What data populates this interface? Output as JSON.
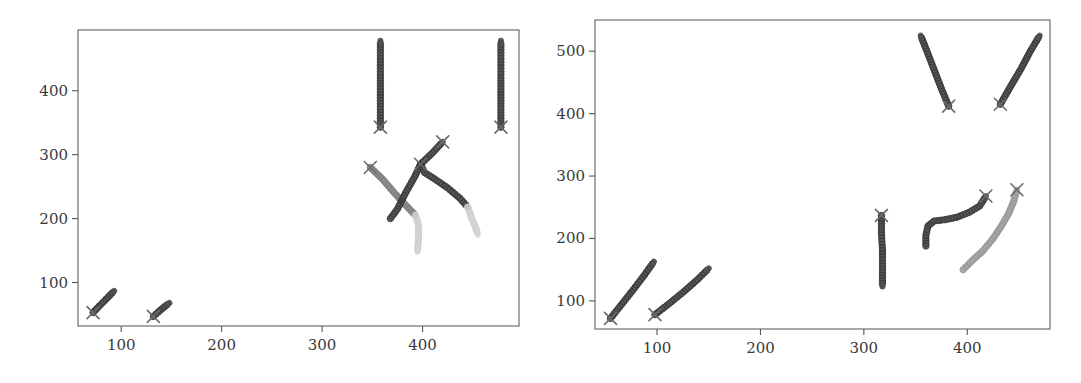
{
  "chart_data": [
    {
      "type": "scatter",
      "title": "",
      "xlabel": "",
      "ylabel": "",
      "xlim": [
        57,
        496
      ],
      "ylim": [
        32,
        495
      ],
      "xticks": [
        100,
        200,
        300,
        400
      ],
      "yticks": [
        100,
        200,
        300,
        400
      ],
      "grid": false,
      "legend": "none",
      "marker_start": "x",
      "marker_trail": "circle",
      "series": [
        {
          "name": "trajectory-1",
          "shade": "dark",
          "start": [
            72,
            53
          ],
          "points": [
            [
              72,
              53
            ],
            [
              78,
              63
            ],
            [
              85,
              74
            ],
            [
              93,
              87
            ]
          ]
        },
        {
          "name": "trajectory-2",
          "shade": "dark",
          "start": [
            132,
            47
          ],
          "points": [
            [
              132,
              47
            ],
            [
              137,
              54
            ],
            [
              143,
              62
            ],
            [
              148,
              68
            ]
          ]
        },
        {
          "name": "trajectory-3",
          "shade": "dark",
          "start": [
            358,
            343
          ],
          "points": [
            [
              358,
              343
            ],
            [
              358,
              380
            ],
            [
              358,
              420
            ],
            [
              358,
              455
            ],
            [
              358,
              478
            ]
          ]
        },
        {
          "name": "trajectory-4",
          "shade": "dark",
          "start": [
            478,
            343
          ],
          "points": [
            [
              478,
              343
            ],
            [
              478,
              380
            ],
            [
              478,
              420
            ],
            [
              478,
              455
            ],
            [
              478,
              478
            ]
          ]
        },
        {
          "name": "trajectory-5",
          "shade": "mid",
          "start": [
            348,
            280
          ],
          "points": [
            [
              348,
              280
            ],
            [
              360,
              262
            ],
            [
              372,
              240
            ],
            [
              385,
              218
            ],
            [
              393,
              205
            ]
          ]
        },
        {
          "name": "trajectory-5-tail",
          "shade": "light",
          "start": null,
          "points": [
            [
              393,
              205
            ],
            [
              396,
              190
            ],
            [
              396,
              170
            ],
            [
              395,
              148
            ]
          ]
        },
        {
          "name": "trajectory-6",
          "shade": "dark",
          "start": [
            420,
            320
          ],
          "points": [
            [
              368,
              200
            ],
            [
              375,
              215
            ],
            [
              383,
              240
            ],
            [
              392,
              265
            ],
            [
              398,
              285
            ],
            [
              410,
              303
            ],
            [
              420,
              320
            ]
          ]
        },
        {
          "name": "trajectory-7",
          "shade": "dark",
          "start": [
            398,
            285
          ],
          "points": [
            [
              398,
              285
            ],
            [
              402,
              272
            ],
            [
              412,
              262
            ],
            [
              425,
              248
            ],
            [
              437,
              232
            ],
            [
              445,
              218
            ]
          ]
        },
        {
          "name": "trajectory-7-tail",
          "shade": "light",
          "start": null,
          "points": [
            [
              445,
              218
            ],
            [
              449,
              200
            ],
            [
              453,
              185
            ],
            [
              455,
              175
            ]
          ]
        }
      ]
    },
    {
      "type": "scatter",
      "title": "",
      "xlabel": "",
      "ylabel": "",
      "xlim": [
        40,
        480
      ],
      "ylim": [
        55,
        550
      ],
      "xticks": [
        100,
        200,
        300,
        400
      ],
      "yticks": [
        100,
        200,
        300,
        400,
        500
      ],
      "grid": false,
      "legend": "none",
      "marker_start": "x",
      "marker_trail": "circle",
      "series": [
        {
          "name": "trajectory-1",
          "shade": "dark",
          "start": [
            55,
            72
          ],
          "points": [
            [
              55,
              72
            ],
            [
              66,
              95
            ],
            [
              77,
              118
            ],
            [
              88,
              142
            ],
            [
              97,
              163
            ]
          ]
        },
        {
          "name": "trajectory-2",
          "shade": "dark",
          "start": [
            98,
            78
          ],
          "points": [
            [
              98,
              78
            ],
            [
              112,
              96
            ],
            [
              126,
              115
            ],
            [
              139,
              134
            ],
            [
              150,
              152
            ]
          ]
        },
        {
          "name": "trajectory-3",
          "shade": "dark",
          "start": [
            317,
            237
          ],
          "points": [
            [
              317,
              237
            ],
            [
              317,
              210
            ],
            [
              318,
              180
            ],
            [
              318,
              150
            ],
            [
              318,
              123
            ]
          ]
        },
        {
          "name": "trajectory-4",
          "shade": "dark",
          "start": [
            418,
            268
          ],
          "points": [
            [
              360,
              188
            ],
            [
              360,
              205
            ],
            [
              362,
              220
            ],
            [
              368,
              228
            ],
            [
              378,
              230
            ],
            [
              390,
              234
            ],
            [
              402,
              242
            ],
            [
              412,
              252
            ],
            [
              418,
              268
            ]
          ]
        },
        {
          "name": "trajectory-5",
          "shade": "light-mid",
          "start": [
            448,
            278
          ],
          "points": [
            [
              396,
              150
            ],
            [
              405,
              165
            ],
            [
              415,
              180
            ],
            [
              425,
              200
            ],
            [
              433,
              220
            ],
            [
              440,
              240
            ],
            [
              445,
              260
            ],
            [
              448,
              278
            ]
          ]
        },
        {
          "name": "trajectory-6",
          "shade": "dark",
          "start": [
            382,
            412
          ],
          "points": [
            [
              382,
              412
            ],
            [
              375,
              440
            ],
            [
              368,
              470
            ],
            [
              361,
              500
            ],
            [
              355,
              525
            ]
          ]
        },
        {
          "name": "trajectory-7",
          "shade": "dark",
          "start": [
            432,
            415
          ],
          "points": [
            [
              432,
              415
            ],
            [
              442,
              444
            ],
            [
              452,
              472
            ],
            [
              461,
              500
            ],
            [
              470,
              525
            ]
          ]
        }
      ]
    }
  ],
  "shades": {
    "dark": "#3c3c3c",
    "mid": "#7f7f7f",
    "light-mid": "#9a9a9a",
    "light": "#d0d0d0",
    "xmark": "#6a6a6a"
  }
}
